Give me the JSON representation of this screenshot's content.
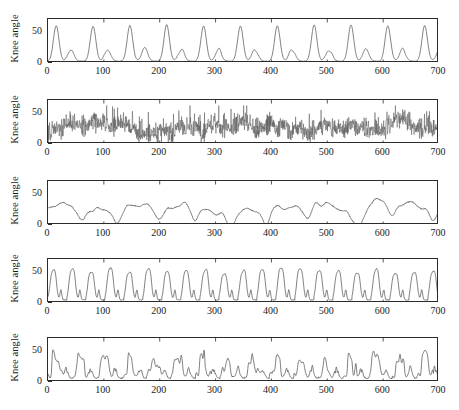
{
  "figure": {
    "width": 459,
    "height": 410,
    "background": "#ffffff",
    "line_color": "#555555",
    "axis_color": "#2b2b2b",
    "panel_count": 5
  },
  "axes": {
    "ylabel": "Knee angle",
    "yticks": [
      0,
      50
    ],
    "ytick_labels": [
      "0",
      "50"
    ],
    "ylim": [
      0,
      72
    ],
    "xticks": [
      0,
      100,
      200,
      300,
      400,
      500,
      600,
      700
    ],
    "xtick_labels": [
      "0",
      "100",
      "200",
      "300",
      "400",
      "500",
      "600",
      "700"
    ],
    "xlim": [
      0,
      700
    ],
    "grid": false,
    "legend": null,
    "title": null,
    "xlabel": ""
  },
  "chart_data": {
    "type": "line",
    "title": "",
    "xlabel": "",
    "ylabel": "Knee angle",
    "xlim": [
      0,
      700
    ],
    "ylim": [
      0,
      72
    ],
    "xticks": [
      0,
      100,
      200,
      300,
      400,
      500,
      600,
      700
    ],
    "yticks": [
      0,
      50
    ],
    "grid": false,
    "legend_position": "none",
    "subplot_layout": "5 rows x 1 column, shared axes",
    "series": [
      {
        "name": "panel-1",
        "description": "Clean periodic gait signal: alternating tall primary peak (~62) and smaller secondary peak (~22) per cycle, period about 66 samples, minima near 2",
        "ylabel": "Knee angle",
        "period": 66,
        "peak_high": 62,
        "peak_low": 22,
        "baseline": 3,
        "noise": 0.6,
        "style": "smooth-biphasic",
        "seed": 11
      },
      {
        "name": "panel-2",
        "description": "Dense high-frequency noisy signal, rapid oscillation spanning roughly 2 to 62 with mean drift around 25",
        "ylabel": "Knee angle",
        "period": 66,
        "peak_high": 62,
        "peak_low": 30,
        "baseline": 4,
        "noise": 17,
        "style": "dense-noise",
        "seed": 27
      },
      {
        "name": "panel-3",
        "description": "Smooth low-amplitude wandering signal, mean about 27, occasional peaks to 45 and dips to 5",
        "ylabel": "Knee angle",
        "period": 46,
        "peak_high": 42,
        "peak_low": 20,
        "baseline": 9,
        "noise": 1.5,
        "style": "smooth-wander",
        "seed": 5
      },
      {
        "name": "panel-4",
        "description": "Sharp square-shouldered peaks to about 58 with fast rise and fall, narrow notched troughs near 5, period about 34",
        "ylabel": "Knee angle",
        "period": 34,
        "peak_high": 58,
        "peak_low": 16,
        "baseline": 5,
        "noise": 1.2,
        "style": "square-peaks",
        "seed": 41
      },
      {
        "name": "panel-5",
        "description": "Irregular tall peaks near 55 with varying spacing, broad shoulders and occasional double bumps, troughs near 6",
        "ylabel": "Knee angle",
        "period": 44,
        "peak_high": 55,
        "peak_low": 18,
        "baseline": 6,
        "noise": 1.4,
        "style": "irregular-peaks",
        "seed": 63
      }
    ]
  }
}
